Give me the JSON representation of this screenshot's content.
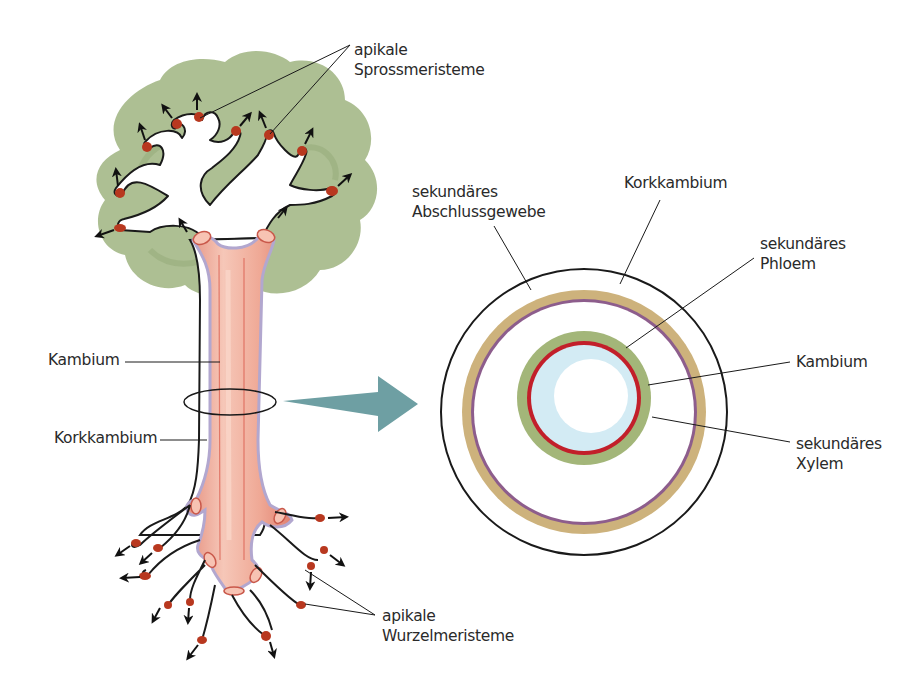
{
  "diagram": {
    "title": "",
    "colors": {
      "foliage": "#a9bc8d",
      "trunk_fill": "#f2b5a3",
      "trunk_stripe": "#d9594a",
      "cambium_line": "#c93a35",
      "cork_line": "#b2a7cf",
      "meristem_tip": "#b8381f",
      "arrow_teal": "#6e9fa3",
      "ring_outer_tan": "#cdb27c",
      "ring_cork_purple": "#8d5d8c",
      "ring_phloem_green": "#a3b679",
      "ring_cambium_red": "#c21f2a",
      "ring_xylem_lightblue": "#d3ebf4",
      "outline": "#1a1a1a"
    },
    "tree_labels": {
      "shoot_meristems": {
        "line1": "apikale",
        "line2": "Sprossmeristeme"
      },
      "cambium": "Kambium",
      "cork_cambium": "Korkkambium",
      "root_meristems": {
        "line1": "apikale",
        "line2": "Wurzelmeristeme"
      }
    },
    "cross_section_labels": {
      "secondary_bark": {
        "line1": "sekundäres",
        "line2": "Abschlussgewebe"
      },
      "cork_cambium": "Korkkambium",
      "secondary_phloem": {
        "line1": "sekundäres",
        "line2": "Phloem"
      },
      "cambium": "Kambium",
      "secondary_xylem": {
        "line1": "sekundäres",
        "line2": "Xylem"
      }
    },
    "cross_section_rings": [
      {
        "name": "outer-boundary",
        "radius": 143,
        "color": "#1a1a1a"
      },
      {
        "name": "secondary-bark",
        "radius": 122,
        "color": "#cdb27c"
      },
      {
        "name": "cork-cambium",
        "radius": 112,
        "color": "#8d5d8c"
      },
      {
        "name": "secondary-phloem",
        "radius": 67,
        "color": "#a3b679"
      },
      {
        "name": "vascular-cambium",
        "radius": 57,
        "color": "#c21f2a"
      },
      {
        "name": "secondary-xylem",
        "radius": 53,
        "color": "#d3ebf4"
      },
      {
        "name": "pith",
        "radius": 37,
        "color": "#ffffff"
      }
    ]
  }
}
